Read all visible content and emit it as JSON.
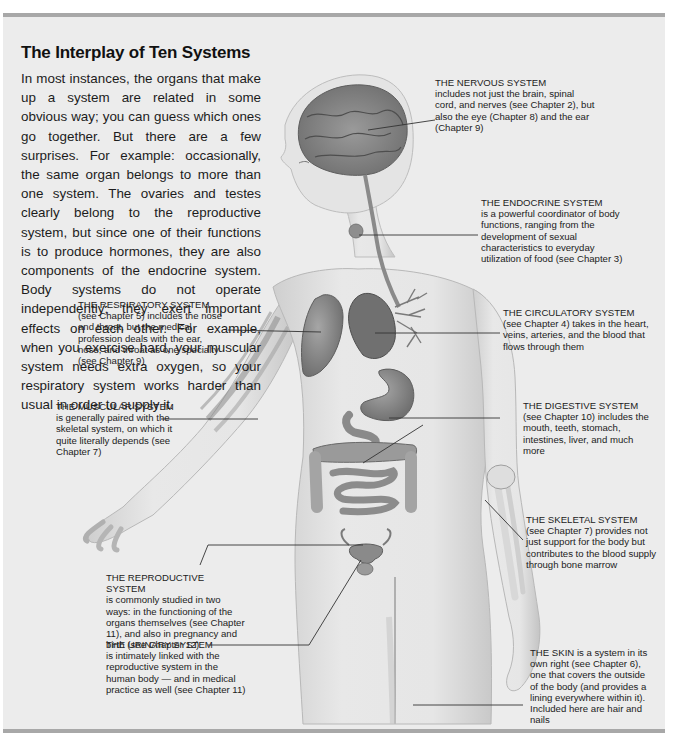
{
  "article": {
    "title": "The Interplay of Ten Systems",
    "intro": "In most instances, the organs that make up a system are related in some obvious way; you can guess which ones go together. But there are a few surprises. For example: occasionally, the same organ belongs to more than one system. The ovaries and testes clearly belong to the reproductive system, but since one of their functions is to produce hormones, they are also components of the endocrine system. Body systems do not operate independently; they exert important effects on each other. For example, when you exercise hard, your muscular system needs extra oxygen, so your respiratory system works harder than usual in order to supply it."
  },
  "labels": {
    "nervous": {
      "heading": "THE NERVOUS SYSTEM",
      "body": "includes not just the brain, spinal cord, and nerves (see Chapter 2), but also the eye (Chapter 8) and the ear (Chapter 9)"
    },
    "endocrine": {
      "heading": "THE ENDOCRINE SYSTEM",
      "body": "is a powerful coordinator of body functions, ranging from the development of sexual characteristics to everyday utilization of food (see Chapter 3)"
    },
    "respiratory": {
      "heading": "THE RESPIRATORY SYSTEM",
      "body": "(see Chapter 5) includes the nose and throat, but the medical profession deals with the ear, nose, and throat as one specialty (see Chapter 9)"
    },
    "circulatory": {
      "heading": "THE CIRCULATORY SYSTEM",
      "body": "(see Chapter 4) takes in the heart, veins, arteries, and the blood that flows through them"
    },
    "muscular": {
      "heading": "THE MUSCULAR SYSTEM",
      "body": "is generally paired with the skeletal system, on which it quite literally depends (see Chapter 7)"
    },
    "digestive": {
      "heading": "THE DIGESTIVE SYSTEM",
      "body": "(see Chapter 10) includes the mouth, teeth, stomach, intestines, liver, and much more"
    },
    "skeletal": {
      "heading": "THE SKELETAL SYSTEM",
      "body": "(see Chapter 7) provides not just support for the body but contributes to the blood supply through bone marrow"
    },
    "reproductive": {
      "heading": "THE REPRODUCTIVE SYSTEM",
      "body": "is commonly studied in two ways: in the functioning of the organs themselves (see Chapter 11), and also in pregnancy and birth (see Chapter 12)"
    },
    "urinary": {
      "heading": "THE URINARY SYSTEM",
      "body": "is intimately linked with the reproductive system in the human body — and in medical practice as well (see Chapter 11)"
    },
    "skin": {
      "heading": "THE SKIN is a system in its own right (see Chapter 6), one that covers the outside of the body (and provides a lining everywhere within it). Included here are hair and nails",
      "body": ""
    }
  },
  "colors": {
    "panel_bg": "#ececec",
    "rule": "#a8a8a8",
    "skin": "#e2e2e2",
    "organ": "#8c8c8c",
    "text": "#1a1a1a"
  }
}
